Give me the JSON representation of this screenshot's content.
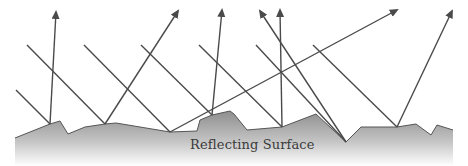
{
  "diagram": {
    "surface_label": "Reflecting Surface",
    "colors": {
      "ray": "#4a4a4a",
      "surface_top": "#8c8c8c",
      "surface_bottom": "#ffffff",
      "surface_edge": "#555555",
      "background": "#ffffff"
    },
    "surface_points": [
      [
        15,
        138
      ],
      [
        50,
        124
      ],
      [
        60,
        121
      ],
      [
        68,
        134
      ],
      [
        85,
        127
      ],
      [
        105,
        124
      ],
      [
        116,
        123
      ],
      [
        170,
        132
      ],
      [
        197,
        131
      ],
      [
        200,
        120
      ],
      [
        212,
        115
      ],
      [
        230,
        111
      ],
      [
        234,
        114
      ],
      [
        247,
        130
      ],
      [
        282,
        127
      ],
      [
        316,
        114
      ],
      [
        346,
        142
      ],
      [
        361,
        127
      ],
      [
        397,
        127
      ],
      [
        416,
        124
      ],
      [
        431,
        135
      ],
      [
        437,
        125
      ],
      [
        453,
        130
      ],
      [
        453,
        166
      ],
      [
        15,
        166
      ]
    ],
    "incident_rays": [
      {
        "from": [
          16,
          90
        ],
        "to": [
          50,
          124
        ]
      },
      {
        "from": [
          27,
          45
        ],
        "to": [
          105,
          124
        ]
      },
      {
        "from": [
          84,
          45
        ],
        "to": [
          170,
          132
        ]
      },
      {
        "from": [
          141,
          45
        ],
        "to": [
          212,
          115
        ]
      },
      {
        "from": [
          199,
          45
        ],
        "to": [
          282,
          127
        ]
      },
      {
        "from": [
          256,
          45
        ],
        "to": [
          346,
          142
        ]
      },
      {
        "from": [
          313,
          45
        ],
        "to": [
          397,
          127
        ]
      }
    ],
    "reflected_rays": [
      {
        "from": [
          50,
          124
        ],
        "to": [
          56,
          12
        ]
      },
      {
        "from": [
          105,
          124
        ],
        "to": [
          178,
          11
        ]
      },
      {
        "from": [
          170,
          132
        ],
        "to": [
          397,
          10
        ]
      },
      {
        "from": [
          212,
          115
        ],
        "to": [
          222,
          10
        ]
      },
      {
        "from": [
          282,
          127
        ],
        "to": [
          280,
          10
        ]
      },
      {
        "from": [
          346,
          142
        ],
        "to": [
          260,
          11
        ]
      },
      {
        "from": [
          397,
          127
        ],
        "to": [
          452,
          11
        ]
      }
    ]
  }
}
